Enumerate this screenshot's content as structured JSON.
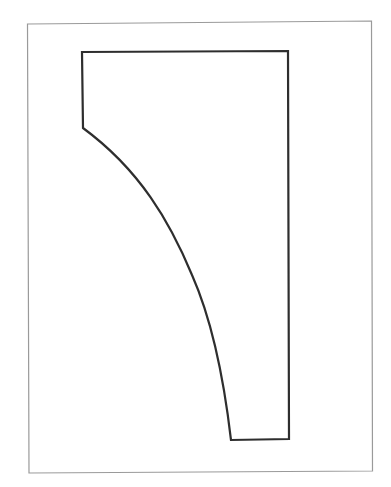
{
  "diagram": {
    "type": "template-outline",
    "colors": {
      "background": "#ffffff",
      "frame": "#9a9a9a",
      "outline": "#2e2e2e"
    },
    "elements": [
      {
        "name": "page-border-frame",
        "kind": "rectangle"
      },
      {
        "name": "pattern-shape",
        "kind": "closed-path",
        "edges": [
          "top-straight",
          "right-straight",
          "bottom-straight",
          "left-curved",
          "left-short-straight"
        ]
      }
    ]
  }
}
